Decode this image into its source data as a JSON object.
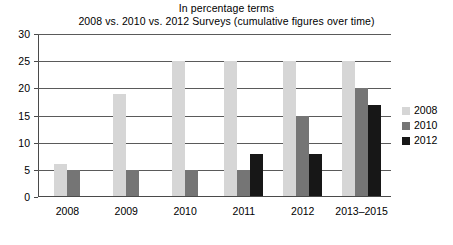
{
  "chart_data": {
    "type": "bar",
    "title": "In percentage terms",
    "subtitle": "2008 vs. 2010 vs. 2012 Surveys (cumulative figures over time)",
    "xlabel": "",
    "ylabel": "",
    "ylim": [
      0,
      30
    ],
    "yticks": [
      0,
      5,
      10,
      15,
      20,
      25,
      30
    ],
    "ytick_labels": [
      "0",
      "5",
      "10",
      "15",
      "20",
      "25",
      "30"
    ],
    "grid": true,
    "legend_position": "right",
    "categories": [
      "2008",
      "2009",
      "2010",
      "2011",
      "2012",
      "2013–2015"
    ],
    "series": [
      {
        "name": "2008",
        "color": "#d6d6d6",
        "values": [
          6,
          19,
          25,
          25,
          25,
          25
        ]
      },
      {
        "name": "2010",
        "color": "#757575",
        "values": [
          5,
          5,
          5,
          5,
          15,
          20
        ]
      },
      {
        "name": "2012",
        "color": "#171717",
        "values": [
          null,
          null,
          null,
          8,
          8,
          17
        ]
      }
    ]
  },
  "legend": {
    "items": [
      {
        "label": "2008"
      },
      {
        "label": "2010"
      },
      {
        "label": "2012"
      }
    ]
  }
}
